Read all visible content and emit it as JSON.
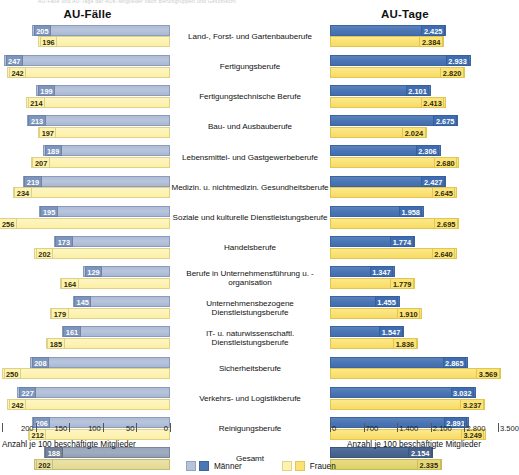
{
  "top_strip_text": "AU-Fälle und AU-Tage der AOK-Mitglieder nach Berufsgruppen und Geschlecht",
  "panels": {
    "left": {
      "title": "AU-Fälle",
      "axis_caption": "Anzahl je 100 beschäftigte Mitglieder",
      "ticks": [
        "250",
        "200",
        "150",
        "100",
        "50",
        "0"
      ],
      "axis_max": 250,
      "axis_min": 0,
      "reversed": true
    },
    "right": {
      "title": "AU-Tage",
      "axis_caption": "Anzahl je 100 beschäftigte Mitglieder",
      "ticks": [
        "0",
        "700",
        "1.400",
        "2.100",
        "2.800",
        "3.500"
      ],
      "axis_max": 3500,
      "axis_min": 0,
      "reversed": false
    }
  },
  "legend": [
    {
      "label": "Männer",
      "color_light": "#b6c3da",
      "color_dark": "#4a76b4"
    },
    {
      "label": "Frauen",
      "color_light": "#fdf2ae",
      "color_dark": "#fbe277"
    }
  ],
  "chart_data": {
    "type": "bar",
    "orientation": "horizontal",
    "title": "AU-Fälle und AU-Tage der AOK-Mitglieder nach Berufsgruppen und Geschlecht",
    "panels": [
      "AU-Fälle",
      "AU-Tage"
    ],
    "series_names": [
      "Männer",
      "Frauen"
    ],
    "xlabel": "Anzahl je 100 beschäftigte Mitglieder",
    "ylabel": "",
    "grid": false,
    "legend_position": "bottom",
    "xlim_left": [
      0,
      250
    ],
    "xlim_right": [
      0,
      3500
    ],
    "categories": [
      "Land-, Forst- und Gartenbauberufe",
      "Fertigungsberufe",
      "Fertigungstechnische Berufe",
      "Bau- und Ausbauberufe",
      "Lebensmittel- und Gastgewerbeberufe",
      "Medizin. u. nichtmedizin. Gesundheitsberufe",
      "Soziale und kulturelle Dienstleistungsberufe",
      "Handelsberufe",
      "Berufe in Unternehmensführung u. -organisation",
      "Unternehmensbezogene Dienstleistungsberufe",
      "IT- u. naturwissenschaftl. Dienstleistungsberufe",
      "Sicherheitsberufe",
      "Verkehrs- und Logistikberufe",
      "Reinigungsberufe",
      "Gesamt"
    ],
    "au_faelle": {
      "Männer": [
        205,
        247,
        199,
        213,
        189,
        219,
        195,
        173,
        129,
        145,
        161,
        208,
        227,
        206,
        188
      ],
      "Frauen": [
        196,
        242,
        214,
        197,
        207,
        234,
        256,
        202,
        164,
        179,
        185,
        250,
        242,
        212,
        202
      ]
    },
    "au_tage": {
      "Männer": [
        2425,
        2933,
        2101,
        2675,
        2306,
        2427,
        1958,
        1774,
        1347,
        1455,
        1547,
        2865,
        3032,
        2891,
        2154
      ],
      "Frauen": [
        2384,
        2820,
        2413,
        2024,
        2680,
        2645,
        2695,
        2640,
        1779,
        1910,
        1836,
        3569,
        3237,
        3249,
        2335
      ]
    },
    "au_faelle_labels": {
      "Männer": [
        "205",
        "247",
        "199",
        "213",
        "189",
        "219",
        "195",
        "173",
        "129",
        "145",
        "161",
        "208",
        "227",
        "206",
        "188"
      ],
      "Frauen": [
        "196",
        "242",
        "214",
        "197",
        "207",
        "234",
        "256",
        "202",
        "164",
        "179",
        "185",
        "250",
        "242",
        "212",
        "202"
      ]
    },
    "au_tage_labels": {
      "Männer": [
        "2.425",
        "2.933",
        "2.101",
        "2.675",
        "2.306",
        "2.427",
        "1.958",
        "1.774",
        "1.347",
        "1.455",
        "1.547",
        "2.865",
        "3.032",
        "2.891",
        "2.154"
      ],
      "Frauen": [
        "2.384",
        "2.820",
        "2.413",
        "2.024",
        "2.680",
        "2.645",
        "2.695",
        "2.640",
        "1.779",
        "1.910",
        "1.836",
        "3.569",
        "3.237",
        "3.249",
        "2.335"
      ]
    }
  }
}
